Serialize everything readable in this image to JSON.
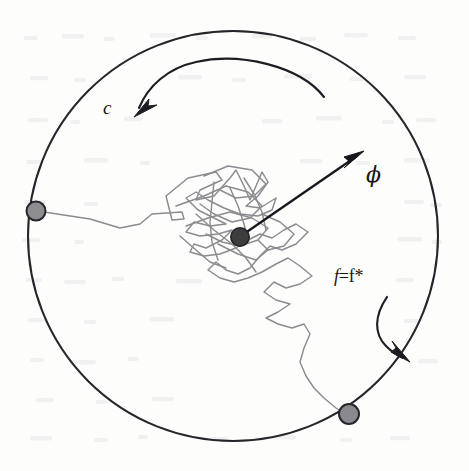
{
  "figure": {
    "kind": "scientific-diagram",
    "labels": {
      "rotation_label": "c",
      "angle_label": "ϕ",
      "frequency_label_italic": "f",
      "frequency_label_rest": "=f*"
    },
    "colors": {
      "boundary_stroke": "#2b2b30",
      "walk_stroke": "#8d8d92",
      "center_node_fill": "#3a3a3e",
      "boundary_node_fill": "#8c8c90",
      "node_stroke": "#2b2b30",
      "arrow_stroke": "#1d1d21",
      "background": "#fdfdfc",
      "text": "#15151a"
    },
    "geometry": {
      "circle_center_x": 233,
      "circle_center_y": 236,
      "circle_radius": 205,
      "center_node_x": 240,
      "center_node_y": 237,
      "center_node_r": 9,
      "left_node_x": 36,
      "left_node_y": 211,
      "left_node_r": 9.5,
      "bottom_node_x": 349,
      "bottom_node_y": 414,
      "bottom_node_r": 10
    },
    "elements": [
      "outer-circle",
      "random-walk-path",
      "center-particle",
      "left-boundary-particle",
      "bottom-boundary-particle",
      "phi-radial-arrow",
      "c-rotation-arc-arrow",
      "f-rotation-arc-arrow"
    ]
  }
}
